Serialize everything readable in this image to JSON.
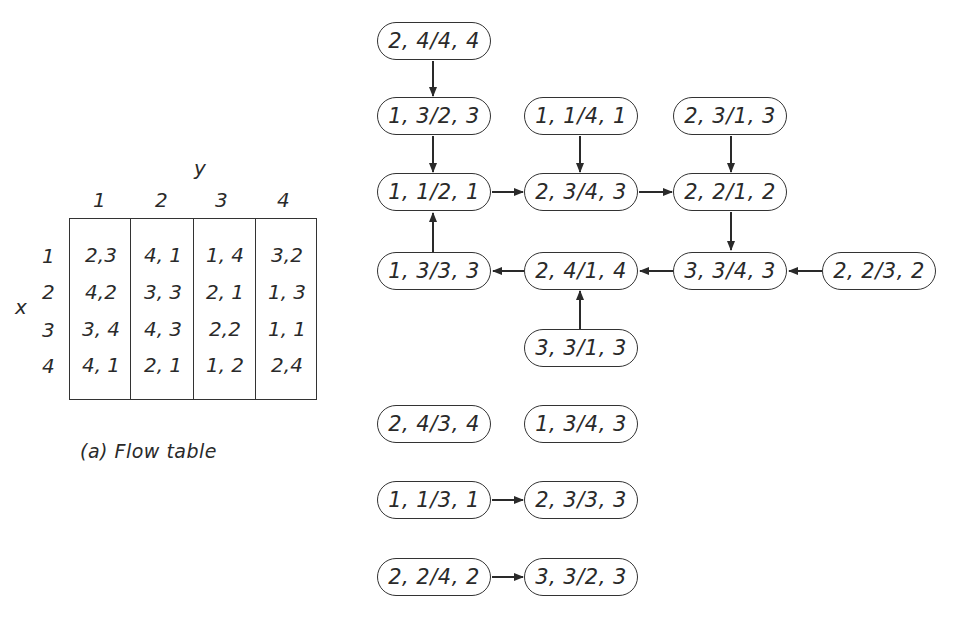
{
  "flow_table": {
    "y_axis_label": "y",
    "x_axis_label": "x",
    "column_headers": [
      "1",
      "2",
      "3",
      "4"
    ],
    "row_headers": [
      "1",
      "2",
      "3",
      "4"
    ],
    "rows": [
      [
        "2,3",
        "4, 1",
        "1, 4",
        "3,2"
      ],
      [
        "4,2",
        "3, 3",
        "2, 1",
        "1, 3"
      ],
      [
        "3, 4",
        "4, 3",
        "2,2",
        "1, 1"
      ],
      [
        "4, 1",
        "2, 1",
        "1, 2",
        "2,4"
      ]
    ],
    "caption": "(a) Flow table"
  },
  "graph": {
    "nodes": [
      {
        "id": "n1",
        "label": "2, 4/4, 4"
      },
      {
        "id": "n2",
        "label": "1, 3/2, 3"
      },
      {
        "id": "n3",
        "label": "1, 1/4, 1"
      },
      {
        "id": "n4",
        "label": "2, 3/1, 3"
      },
      {
        "id": "n5",
        "label": "1, 1/2, 1"
      },
      {
        "id": "n6",
        "label": "2, 3/4, 3"
      },
      {
        "id": "n7",
        "label": "2, 2/1, 2"
      },
      {
        "id": "n8",
        "label": "1, 3/3, 3"
      },
      {
        "id": "n9",
        "label": "2, 4/1, 4"
      },
      {
        "id": "n10",
        "label": "3, 3/4, 3"
      },
      {
        "id": "n11",
        "label": "2, 2/3, 2"
      },
      {
        "id": "n12",
        "label": "3, 3/1, 3"
      },
      {
        "id": "n13",
        "label": "2, 4/3, 4"
      },
      {
        "id": "n14",
        "label": "1, 3/4, 3"
      },
      {
        "id": "n15",
        "label": "1, 1/3, 1"
      },
      {
        "id": "n16",
        "label": "2, 3/3, 3"
      },
      {
        "id": "n17",
        "label": "2, 2/4, 2"
      },
      {
        "id": "n18",
        "label": "3, 3/2, 3"
      }
    ],
    "edges": [
      [
        "2, 4/4, 4",
        "1, 3/2, 3"
      ],
      [
        "1, 3/2, 3",
        "1, 1/2, 1"
      ],
      [
        "1, 1/4, 1",
        "2, 3/4, 3"
      ],
      [
        "2, 3/1, 3",
        "2, 2/1, 2"
      ],
      [
        "1, 1/2, 1",
        "2, 3/4, 3"
      ],
      [
        "2, 3/4, 3",
        "2, 2/1, 2"
      ],
      [
        "2, 2/1, 2",
        "3, 3/4, 3"
      ],
      [
        "1, 3/3, 3",
        "1, 1/2, 1"
      ],
      [
        "2, 4/1, 4",
        "1, 3/3, 3"
      ],
      [
        "3, 3/4, 3",
        "2, 4/1, 4"
      ],
      [
        "2, 2/3, 2",
        "3, 3/4, 3"
      ],
      [
        "3, 3/1, 3",
        "2, 4/1, 4"
      ],
      [
        "1, 1/3, 1",
        "2, 3/3, 3"
      ],
      [
        "2, 2/4, 2",
        "3, 3/2, 3"
      ]
    ]
  }
}
